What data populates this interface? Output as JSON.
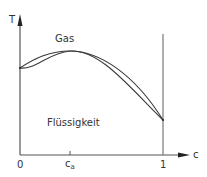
{
  "diagram": {
    "type": "phase-diagram",
    "y_axis": {
      "label": "T"
    },
    "x_axis": {
      "label": "c",
      "ticks": [
        {
          "label": "0",
          "position": 0
        },
        {
          "label": "c",
          "subscript": "a",
          "position": "c_a"
        },
        {
          "label": "1",
          "position": 1
        }
      ]
    },
    "regions": {
      "upper": "Gas",
      "lower": "Flüssigkeit"
    },
    "curves": [
      {
        "name": "dew-curve",
        "description": "upper boundary (vapor line)"
      },
      {
        "name": "boiling-curve",
        "description": "lower boundary (liquid line)"
      }
    ],
    "special_points": [
      {
        "name": "azeotrope",
        "at": "c_a",
        "description": "curves touch at temperature maximum"
      }
    ],
    "colors": {
      "line": "#3a3a3a",
      "axis": "#555555",
      "background": "#ffffff"
    }
  }
}
